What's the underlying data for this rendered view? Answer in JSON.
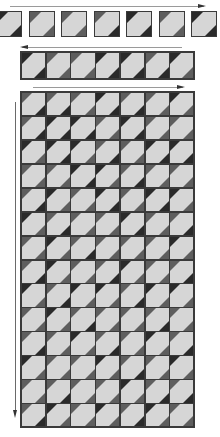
{
  "diagram": {
    "colors": {
      "background": "#ffffff",
      "block_light": "#d6d6d6",
      "block_border": "#3a3a3a",
      "shade_dark": "#2a2a2a",
      "shade_medium": "#5e5e5e",
      "arrow": "#9a9a9a"
    },
    "row1": {
      "label": "individual blocks",
      "count": 7,
      "arrow_direction": "right",
      "tl": [
        "d",
        "m",
        "m",
        "m",
        "d",
        "m",
        "d"
      ],
      "br": [
        "d",
        "m",
        "m",
        "d",
        "d",
        "m",
        "d"
      ]
    },
    "row2": {
      "label": "joined strip",
      "count": 7,
      "arrow_direction": "left",
      "tl": [
        "d",
        "m",
        "m",
        "d",
        "d",
        "m",
        "d"
      ],
      "br": [
        "d",
        "m",
        "m",
        "d",
        "d",
        "d",
        "m"
      ]
    },
    "grid": {
      "label": "assembled quilt top",
      "columns": 7,
      "rows": 14,
      "arrow_top_direction": "right",
      "arrow_side_direction": "down",
      "tl": [
        [
          "m",
          "m",
          "m",
          "d",
          "m",
          "m",
          "d"
        ],
        [
          "m",
          "d",
          "d",
          "m",
          "d",
          "m",
          "m"
        ],
        [
          "d",
          "d",
          "d",
          "m",
          "m",
          "d",
          "d"
        ],
        [
          "m",
          "m",
          "d",
          "d",
          "m",
          "m",
          "m"
        ],
        [
          "m",
          "d",
          "m",
          "d",
          "m",
          "d",
          "d"
        ],
        [
          "d",
          "m",
          "m",
          "m",
          "d",
          "m",
          "m"
        ],
        [
          "m",
          "d",
          "m",
          "m",
          "m",
          "m",
          "d"
        ],
        [
          "m",
          "d",
          "m",
          "m",
          "d",
          "m",
          "m"
        ],
        [
          "d",
          "m",
          "d",
          "d",
          "m",
          "d",
          "d"
        ],
        [
          "m",
          "d",
          "m",
          "m",
          "m",
          "m",
          "m"
        ],
        [
          "m",
          "m",
          "d",
          "m",
          "m",
          "d",
          "m"
        ],
        [
          "d",
          "m",
          "m",
          "d",
          "m",
          "m",
          "d"
        ],
        [
          "m",
          "m",
          "m",
          "m",
          "d",
          "m",
          "m"
        ],
        [
          "m",
          "d",
          "m",
          "d",
          "m",
          "d",
          "m"
        ]
      ],
      "br": [
        [
          "d",
          "d",
          "m",
          "d",
          "d",
          "m",
          "m"
        ],
        [
          "d",
          "d",
          "d",
          "m",
          "d",
          "m",
          "m"
        ],
        [
          "m",
          "d",
          "m",
          "d",
          "m",
          "d",
          "d"
        ],
        [
          "m",
          "m",
          "d",
          "m",
          "d",
          "m",
          "m"
        ],
        [
          "d",
          "m",
          "m",
          "d",
          "m",
          "d",
          "m"
        ],
        [
          "m",
          "d",
          "m",
          "m",
          "d",
          "m",
          "d"
        ],
        [
          "m",
          "m",
          "d",
          "m",
          "m",
          "m",
          "m"
        ],
        [
          "d",
          "m",
          "m",
          "d",
          "m",
          "m",
          "d"
        ],
        [
          "m",
          "d",
          "m",
          "m",
          "d",
          "m",
          "m"
        ],
        [
          "m",
          "m",
          "d",
          "m",
          "m",
          "d",
          "m"
        ],
        [
          "d",
          "m",
          "m",
          "d",
          "m",
          "m",
          "d"
        ],
        [
          "m",
          "m",
          "m",
          "m",
          "d",
          "m",
          "m"
        ],
        [
          "m",
          "d",
          "m",
          "m",
          "m",
          "d",
          "d"
        ],
        [
          "d",
          "m",
          "m",
          "m",
          "d",
          "m",
          "m"
        ]
      ]
    }
  }
}
